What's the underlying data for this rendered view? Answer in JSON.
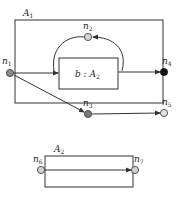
{
  "diagram": {
    "outer_box": {
      "label": "A",
      "label_sub": "1"
    },
    "inner_box": {
      "label": "b : A",
      "label_sub": "2"
    },
    "lower_box": {
      "label": "A",
      "label_sub": "2"
    },
    "nodes": [
      {
        "id": "n1",
        "label": "n",
        "sub": "1",
        "fill": "#8a8a8a"
      },
      {
        "id": "n2",
        "label": "n",
        "sub": "2",
        "fill": "#d4d4d4"
      },
      {
        "id": "n3",
        "label": "n",
        "sub": "3",
        "fill": "#7a7a7a"
      },
      {
        "id": "n4",
        "label": "n",
        "sub": "4",
        "fill": "#111111"
      },
      {
        "id": "n5",
        "label": "n",
        "sub": "5",
        "fill": "#e0e0e0"
      },
      {
        "id": "n6",
        "label": "n",
        "sub": "6",
        "fill": "#cfcfcf"
      },
      {
        "id": "n7",
        "label": "n",
        "sub": "7",
        "fill": "#cfcfcf"
      }
    ],
    "edges": [
      {
        "from": "n1",
        "to": "b"
      },
      {
        "from": "b",
        "to": "n2"
      },
      {
        "from": "n2",
        "to": "b"
      },
      {
        "from": "b",
        "to": "n4"
      },
      {
        "from": "n1",
        "to": "n3"
      },
      {
        "from": "n3",
        "to": "n5"
      },
      {
        "from": "n6",
        "to": "n7"
      }
    ],
    "colors": {
      "stroke": "#333333",
      "background": "#ffffff"
    }
  }
}
